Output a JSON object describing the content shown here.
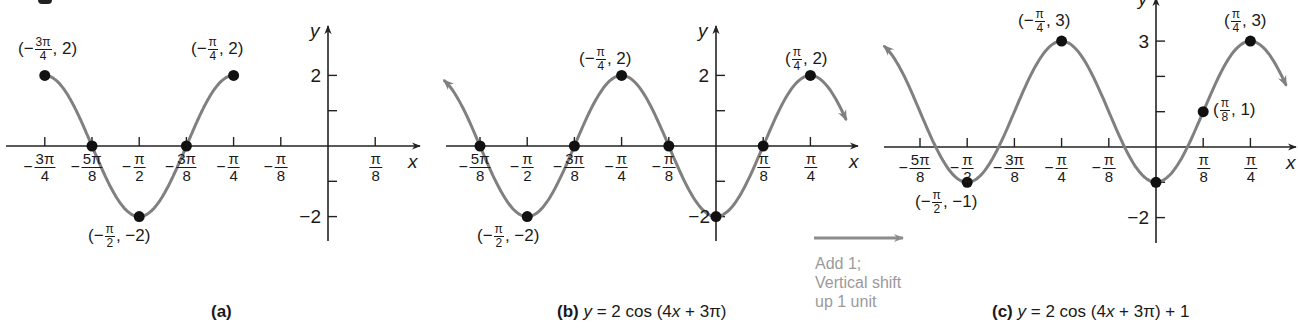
{
  "figure": {
    "note": {
      "lines": [
        "Add 1;",
        "Vertical shift",
        "up 1 unit"
      ],
      "arrow_color": "#8c8c8c",
      "text_color": "#9a9a9a"
    },
    "colors": {
      "curve": "#808080",
      "axis": "#222222",
      "point": "#111111",
      "text": "#1a1a1a"
    }
  },
  "chart_data": [
    {
      "type": "line",
      "panel": "(a)",
      "title": "(a)",
      "equation": "",
      "xlabel": "x",
      "ylabel": "y",
      "xticks": [
        "-3π/4",
        "-5π/8",
        "-π/2",
        "-3π/8",
        "-π/4",
        "-π/8",
        "π/8"
      ],
      "xtick_values_pi_over_8": [
        -6,
        -5,
        -4,
        -3,
        -2,
        -1,
        1
      ],
      "yticks": [
        2,
        1,
        -1,
        -2
      ],
      "ytick_labels": [
        "2",
        "-2"
      ],
      "ylim": [
        -2.6,
        3
      ],
      "function": "2cos(4x+3π)",
      "domain_pi_over_8": [
        -6,
        -2
      ],
      "arrows": false,
      "points": [
        {
          "x": "-3π/4",
          "y": 2,
          "label": "(−3π/4, 2)"
        },
        {
          "x": "-5π/8",
          "y": 0,
          "label": ""
        },
        {
          "x": "-π/2",
          "y": -2,
          "label": "(−π/2, −2)"
        },
        {
          "x": "-3π/8",
          "y": 0,
          "label": ""
        },
        {
          "x": "-π/4",
          "y": 2,
          "label": "(−π/4, 2)"
        }
      ]
    },
    {
      "type": "line",
      "panel": "(b)",
      "title": "(b)",
      "equation": "y = 2 cos (4x + 3π)",
      "xlabel": "x",
      "ylabel": "y",
      "xticks": [
        "-5π/8",
        "-π/2",
        "-3π/8",
        "-π/4",
        "-π/8",
        "π/8",
        "π/4"
      ],
      "xtick_values_pi_over_8": [
        -5,
        -4,
        -3,
        -2,
        -1,
        1,
        2
      ],
      "yticks": [
        2,
        1,
        -1,
        -2
      ],
      "ytick_labels": [
        "2",
        "-2"
      ],
      "function": "2cos(4x+3π)",
      "domain_pi_over_8": [
        -5.75,
        2.75
      ],
      "arrows": true,
      "points": [
        {
          "x": "-5π/8",
          "y": 0,
          "label": ""
        },
        {
          "x": "-π/2",
          "y": -2,
          "label": "(−π/2, −2)"
        },
        {
          "x": "-3π/8",
          "y": 0,
          "label": ""
        },
        {
          "x": "-π/4",
          "y": 2,
          "label": "(−π/4, 2)"
        },
        {
          "x": "-π/8",
          "y": 0,
          "label": ""
        },
        {
          "x": "0",
          "y": -2,
          "label": ""
        },
        {
          "x": "π/8",
          "y": 0,
          "label": ""
        },
        {
          "x": "π/4",
          "y": 2,
          "label": "(π/4, 2)"
        }
      ]
    },
    {
      "type": "line",
      "panel": "(c)",
      "title": "(c)",
      "equation": "y = 2 cos (4x + 3π) + 1",
      "xlabel": "x",
      "ylabel": "y",
      "xticks": [
        "-5π/8",
        "-π/2",
        "-3π/8",
        "-π/4",
        "-π/8",
        "π/8",
        "π/4"
      ],
      "xtick_values_pi_over_8": [
        -5,
        -4,
        -3,
        -2,
        -1,
        1,
        2
      ],
      "yticks": [
        3,
        2,
        1,
        -1,
        -2
      ],
      "ytick_labels": [
        "3",
        "-2"
      ],
      "function": "2cos(4x+3π)+1",
      "domain_pi_over_8": [
        -5.75,
        2.75
      ],
      "arrows": true,
      "points": [
        {
          "x": "-π/2",
          "y": -1,
          "label": "(−π/2, −1)"
        },
        {
          "x": "-π/4",
          "y": 3,
          "label": "(−π/4, 3)"
        },
        {
          "x": "0",
          "y": -1,
          "label": ""
        },
        {
          "x": "π/8",
          "y": 1,
          "label": "(π/8, 1)"
        },
        {
          "x": "π/4",
          "y": 3,
          "label": "(π/4, 3)"
        }
      ]
    }
  ],
  "labels": {
    "a": {
      "pt1_num": "3π",
      "pt1_den": "4",
      "pt1_pre": "(−",
      "pt1_post": ", 2)",
      "pt2_num": "π",
      "pt2_den": "4",
      "pt2_pre": "(−",
      "pt2_post": ", 2)",
      "pt3_num": "π",
      "pt3_den": "2",
      "pt3_pre": "(−",
      "pt3_post": ", −2)",
      "ytop": "2",
      "ybot": "−2",
      "caption": "(a)"
    },
    "b": {
      "pt1_num": "π",
      "pt1_den": "4",
      "pt1_pre": "(−",
      "pt1_post": ", 2)",
      "pt2_num": "π",
      "pt2_den": "4",
      "pt2_pre": "(",
      "pt2_post": ", 2)",
      "pt3_num": "π",
      "pt3_den": "2",
      "pt3_pre": "(−",
      "pt3_post": ", −2)",
      "ytop": "2",
      "ybot": "−2",
      "caption_tag": "(b)",
      "caption_y": "y",
      "caption_rest": " = 2 cos (4",
      "caption_x": "x",
      "caption_tail": " + 3π)"
    },
    "c": {
      "pt1_num": "π",
      "pt1_den": "4",
      "pt1_pre": "(−",
      "pt1_post": ", 3)",
      "pt2_num": "π",
      "pt2_den": "4",
      "pt2_pre": "(",
      "pt2_post": ", 3)",
      "pt3_num": "π",
      "pt3_den": "8",
      "pt3_pre": "(",
      "pt3_post": ", 1)",
      "pt4_num": "π",
      "pt4_den": "2",
      "pt4_pre": "(−",
      "pt4_post": ", −1)",
      "ytop": "3",
      "ybot": "−2",
      "caption_tag": "(c)",
      "caption_y": "y",
      "caption_rest": " = 2 cos (4",
      "caption_x": "x",
      "caption_tail": " + 3π) + 1"
    },
    "axis_x": "x",
    "axis_y": "y",
    "ticks": {
      "m3pi4": {
        "neg": "−",
        "num": "3π",
        "den": "4"
      },
      "m5pi8": {
        "neg": "−",
        "num": "5π",
        "den": "8"
      },
      "mpi2": {
        "neg": "−",
        "num": "π",
        "den": "2"
      },
      "m3pi8": {
        "neg": "−",
        "num": "3π",
        "den": "8"
      },
      "mpi4": {
        "neg": "−",
        "num": "π",
        "den": "4"
      },
      "mpi8": {
        "neg": "−",
        "num": "π",
        "den": "8"
      },
      "pi8": {
        "neg": "",
        "num": "π",
        "den": "8"
      },
      "pi4": {
        "neg": "",
        "num": "π",
        "den": "4"
      }
    }
  }
}
